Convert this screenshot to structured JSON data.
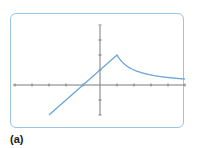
{
  "figure": {
    "label": "(a)",
    "colors": {
      "frame": "#9cc4e4",
      "axis": "#7a7a7a",
      "curve": "#6aa6d8"
    }
  },
  "chart_data": {
    "type": "line",
    "title": "",
    "xlabel": "",
    "ylabel": "",
    "xlim": [
      -5,
      5
    ],
    "ylim": [
      -2,
      4
    ],
    "x_tick_step": 1,
    "y_tick_step": 1,
    "grid": false,
    "legend": null,
    "tick_labels_shown": false,
    "pieces": [
      {
        "expression": "x + 1",
        "domain": [
          -3,
          1
        ],
        "points": [
          [
            -3,
            -2
          ],
          [
            -1,
            0
          ],
          [
            0,
            1
          ],
          [
            1,
            2
          ]
        ]
      },
      {
        "expression": "2 / x",
        "domain": [
          1,
          5
        ],
        "points": [
          [
            1,
            2
          ],
          [
            1.5,
            1.33
          ],
          [
            2,
            1
          ],
          [
            3,
            0.67
          ],
          [
            4,
            0.5
          ],
          [
            5,
            0.4
          ]
        ]
      }
    ],
    "annotations": [
      {
        "type": "cusp",
        "x": 1,
        "y": 2
      },
      {
        "type": "y-intercept",
        "x": 0,
        "y": 1
      }
    ]
  }
}
